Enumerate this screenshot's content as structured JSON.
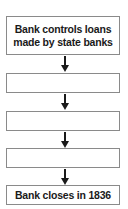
{
  "diagram": {
    "type": "flowchart",
    "direction": "top-to-bottom",
    "boxes": [
      {
        "label": "Bank controls loans made by state banks",
        "line1": "Bank controls loans",
        "line2": "made by state banks"
      },
      {
        "label": ""
      },
      {
        "label": ""
      },
      {
        "label": ""
      },
      {
        "label": "Bank closes in 1836"
      }
    ],
    "arrows": 4,
    "colors": {
      "box_border": "#8a8a8a",
      "text": "#1a1a1a",
      "arrow": "#1a1a1a",
      "background": "#ffffff"
    }
  }
}
